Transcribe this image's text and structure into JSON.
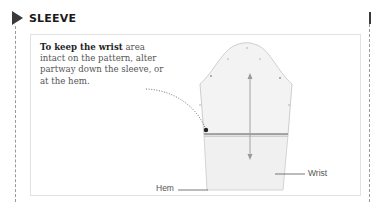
{
  "section": {
    "title": "SLEEVE",
    "marker_icon": "triangle-right-icon"
  },
  "caption": {
    "bold": "To keep the wrist",
    "rest": " area intact on the pattern, alter partway down the sleeve, or at the hem."
  },
  "diagram": {
    "labels": {
      "hem": "Hem",
      "wrist": "Wrist"
    },
    "colors": {
      "pattern_fill": "#f2f2f2",
      "pattern_stroke": "#c8c8c8",
      "alteration_line": "#8c8c8c",
      "text": "#555555"
    }
  }
}
